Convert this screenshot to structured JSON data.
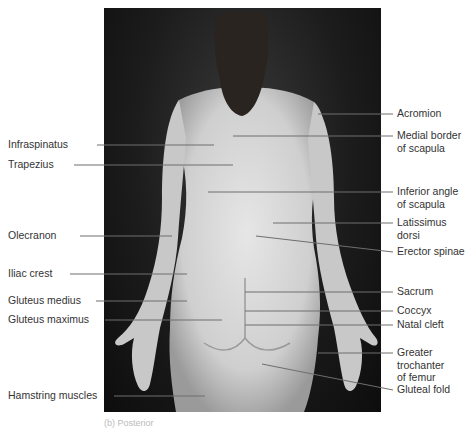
{
  "figure": {
    "caption": "(b) Posterior",
    "colors": {
      "background": "#ffffff",
      "photo_bg": "#151515",
      "skin": "#d9d9d9",
      "leader": "#6e6e6e",
      "text": "#333333"
    },
    "labels_left": [
      {
        "text": "Infraspinatus",
        "y": 145,
        "x": 8,
        "line_from": 97,
        "line_to": 214,
        "line_to_y": 145
      },
      {
        "text": "Trapezius",
        "y": 165,
        "x": 8,
        "line_from": 74,
        "line_to": 233,
        "line_to_y": 165
      },
      {
        "text": "Olecranon",
        "y": 236,
        "x": 8,
        "line_from": 80,
        "line_to": 172,
        "line_to_y": 236
      },
      {
        "text": "Iliac crest",
        "y": 274,
        "x": 8,
        "line_from": 70,
        "line_to": 187,
        "line_to_y": 274
      },
      {
        "text": "Gluteus medius",
        "y": 301,
        "x": 8,
        "line_from": 96,
        "line_to": 187,
        "line_to_y": 301
      },
      {
        "text": "Gluteus maximus",
        "y": 320,
        "x": 8,
        "line_from": 105,
        "line_to": 222,
        "line_to_y": 320
      },
      {
        "text": "Hamstring muscles",
        "y": 396,
        "x": 8,
        "line_from": 114,
        "line_to": 205,
        "line_to_y": 396
      }
    ],
    "labels_right": [
      {
        "lines": [
          "Acromion"
        ],
        "y": 114,
        "line_from": 318,
        "line_from_y": 114
      },
      {
        "lines": [
          "Medial border",
          "of scapula"
        ],
        "y": 136,
        "line_from": 233,
        "line_from_y": 136
      },
      {
        "lines": [
          "Inferior angle",
          "of scapula"
        ],
        "y": 192,
        "line_from": 208,
        "line_from_y": 192
      },
      {
        "lines": [
          "Latissimus",
          "dorsi"
        ],
        "y": 223,
        "line_from": 273,
        "line_from_y": 223
      },
      {
        "lines": [
          "Erector spinae"
        ],
        "y": 252,
        "line_from": 256,
        "line_from_y": 236
      },
      {
        "lines": [
          "Sacrum"
        ],
        "y": 292,
        "line_from": 245,
        "line_from_y": 292
      },
      {
        "lines": [
          "Coccyx"
        ],
        "y": 311,
        "line_from": 245,
        "line_from_y": 311
      },
      {
        "lines": [
          "Natal cleft"
        ],
        "y": 325,
        "line_from": 245,
        "line_from_y": 325
      },
      {
        "lines": [
          "Greater",
          "trochanter",
          "of femur"
        ],
        "y": 353,
        "line_from": 318,
        "line_from_y": 353
      },
      {
        "lines": [
          "Gluteal fold"
        ],
        "y": 390,
        "line_from": 262,
        "line_from_y": 364
      }
    ]
  }
}
